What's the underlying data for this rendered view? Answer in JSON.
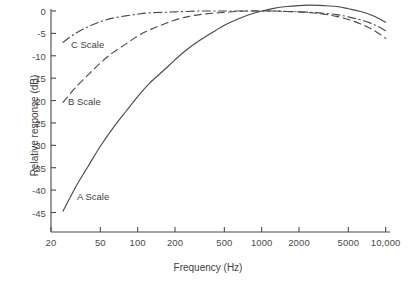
{
  "chart_data": {
    "type": "line",
    "title": "",
    "xlabel": "Frequency (Hz)",
    "ylabel": "Relative response (dB)",
    "xscale": "log",
    "xlim": [
      20,
      12500
    ],
    "ylim": [
      -47,
      3
    ],
    "grid": false,
    "legend_position": "inline-annotations",
    "xticks": [
      20,
      50,
      100,
      200,
      500,
      1000,
      2000,
      5000,
      10000
    ],
    "xticklabels": [
      "20",
      "50",
      "100",
      "200",
      "500",
      "1000",
      "2000",
      "5000",
      "10,000"
    ],
    "yticks": [
      0,
      -5,
      -10,
      -15,
      -20,
      -25,
      -30,
      -35,
      -40,
      -45
    ],
    "yticklabels": [
      "0",
      "-5",
      "-10",
      "-15",
      "-20",
      "-25",
      "-30",
      "-35",
      "-40",
      "-45"
    ],
    "series": [
      {
        "name": "A Scale",
        "style": "solid",
        "annotation": "A Scale",
        "x": [
          25,
          31.5,
          40,
          50,
          63,
          80,
          100,
          125,
          160,
          200,
          250,
          315,
          400,
          500,
          630,
          800,
          1000,
          1250,
          1600,
          2000,
          2500,
          3150,
          4000,
          5000,
          6300,
          8000,
          10000,
          12500
        ],
        "y": [
          -44.7,
          -39.4,
          -34.6,
          -30.2,
          -26.2,
          -22.5,
          -19.1,
          -16.1,
          -13.4,
          -10.9,
          -8.6,
          -6.6,
          -4.8,
          -3.2,
          -1.9,
          -0.8,
          0.0,
          0.6,
          1.0,
          1.2,
          1.3,
          1.2,
          1.0,
          0.5,
          -0.1,
          -1.1,
          -2.5,
          -4.3
        ]
      },
      {
        "name": "B Scale",
        "style": "dashed",
        "annotation": "B Scale",
        "x": [
          25,
          31.5,
          40,
          50,
          63,
          80,
          100,
          125,
          160,
          200,
          250,
          315,
          400,
          500,
          630,
          800,
          1000,
          1250,
          1600,
          2000,
          2500,
          3150,
          4000,
          5000,
          6300,
          8000,
          10000,
          12500
        ],
        "y": [
          -20.4,
          -17.1,
          -14.2,
          -11.6,
          -9.3,
          -7.4,
          -5.6,
          -4.2,
          -3.0,
          -2.0,
          -1.3,
          -0.8,
          -0.5,
          -0.3,
          -0.1,
          0.0,
          0.0,
          0.0,
          -0.1,
          -0.2,
          -0.4,
          -0.7,
          -1.2,
          -1.9,
          -2.9,
          -4.3,
          -6.1,
          -8.4
        ]
      },
      {
        "name": "C Scale",
        "style": "dashdot",
        "annotation": "C Scale",
        "x": [
          25,
          31.5,
          40,
          50,
          63,
          80,
          100,
          125,
          160,
          200,
          250,
          315,
          400,
          500,
          630,
          800,
          1000,
          1250,
          1600,
          2000,
          2500,
          3150,
          4000,
          5000,
          6300,
          8000,
          10000,
          12500
        ],
        "y": [
          -7.0,
          -5.0,
          -3.5,
          -2.4,
          -1.6,
          -1.1,
          -0.7,
          -0.4,
          -0.3,
          -0.2,
          -0.1,
          0.0,
          0.0,
          0.0,
          0.0,
          0.0,
          0.0,
          0.0,
          -0.1,
          -0.2,
          -0.3,
          -0.5,
          -0.8,
          -1.3,
          -2.0,
          -3.0,
          -4.4,
          -6.2
        ]
      }
    ],
    "colors": {
      "axis": "#4a4a4a",
      "series_a": "#4a4a4a",
      "series_b": "#4a4a4a",
      "series_c": "#4a4a4a",
      "background": "#ffffff"
    }
  }
}
